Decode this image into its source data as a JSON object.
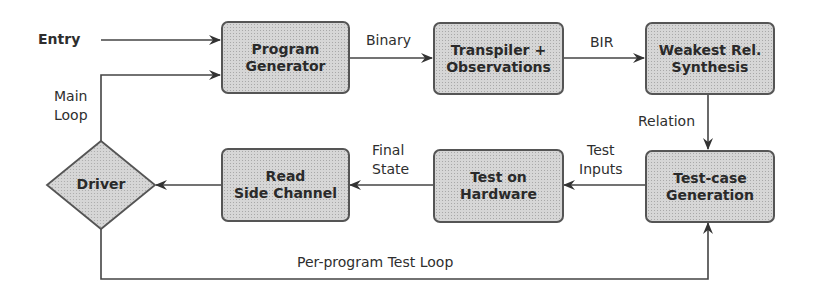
{
  "diagram": {
    "type": "flowchart",
    "entry_label": "Entry",
    "nodes": {
      "program_generator": {
        "line1": "Program",
        "line2": "Generator"
      },
      "transpiler": {
        "line1": "Transpiler +",
        "line2": "Observations"
      },
      "weakest_rel": {
        "line1": "Weakest Rel.",
        "line2": "Synthesis"
      },
      "testcase_gen": {
        "line1": "Test-case",
        "line2": "Generation"
      },
      "test_hardware": {
        "line1": "Test on",
        "line2": "Hardware"
      },
      "read_side_channel": {
        "line1": "Read",
        "line2": "Side Channel"
      },
      "driver": {
        "label": "Driver"
      }
    },
    "edge_labels": {
      "binary": "Binary",
      "bir": "BIR",
      "relation": "Relation",
      "test_inputs_1": "Test",
      "test_inputs_2": "Inputs",
      "final_state_1": "Final",
      "final_state_2": "State",
      "main_loop_1": "Main",
      "main_loop_2": "Loop",
      "per_program_loop": "Per-program Test Loop"
    },
    "colors": {
      "box_fill": "#d6d6d6",
      "box_border": "#555555",
      "line": "#3a3a3a"
    }
  }
}
